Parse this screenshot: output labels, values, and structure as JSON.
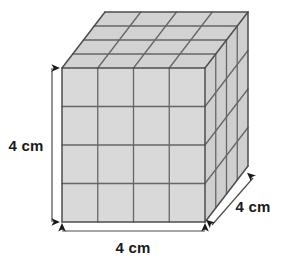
{
  "figure": {
    "shape": "rectangular-prism",
    "unit_cubes_per_edge": 4,
    "grid_rows": 4,
    "grid_cols": 4,
    "grid_layers": 4,
    "background_color": "#ffffff",
    "face_fill_color": "#d9d9d9",
    "top_face_fill_color": "#d2d2d2",
    "right_face_fill_color": "#cfcfcf",
    "grid_line_color": "#666666",
    "outline_color": "#4d4d4d",
    "annotation_color": "#1a1a1a"
  },
  "geometry": {
    "front_face": {
      "left": 62,
      "top": 68,
      "right": 205,
      "bottom": 222,
      "width": 143,
      "height": 154
    },
    "depth_offset": {
      "dx": 43,
      "dy": -56
    },
    "divisions": 4
  },
  "labels": {
    "height": {
      "text": "4 cm",
      "orientation": "vertical",
      "x": 26,
      "y": 151
    },
    "width": {
      "text": "4 cm",
      "orientation": "horizontal",
      "x": 133,
      "y": 253
    },
    "depth": {
      "text": "4 cm",
      "orientation": "diagonal",
      "x": 253,
      "y": 212
    }
  },
  "dimension_lines": {
    "height": {
      "x": 52,
      "y1": 68,
      "y2": 222
    },
    "width": {
      "y": 231,
      "x1": 62,
      "x2": 205
    },
    "depth": {
      "x1": 212,
      "y1": 225,
      "x2": 253,
      "y2": 178
    }
  }
}
